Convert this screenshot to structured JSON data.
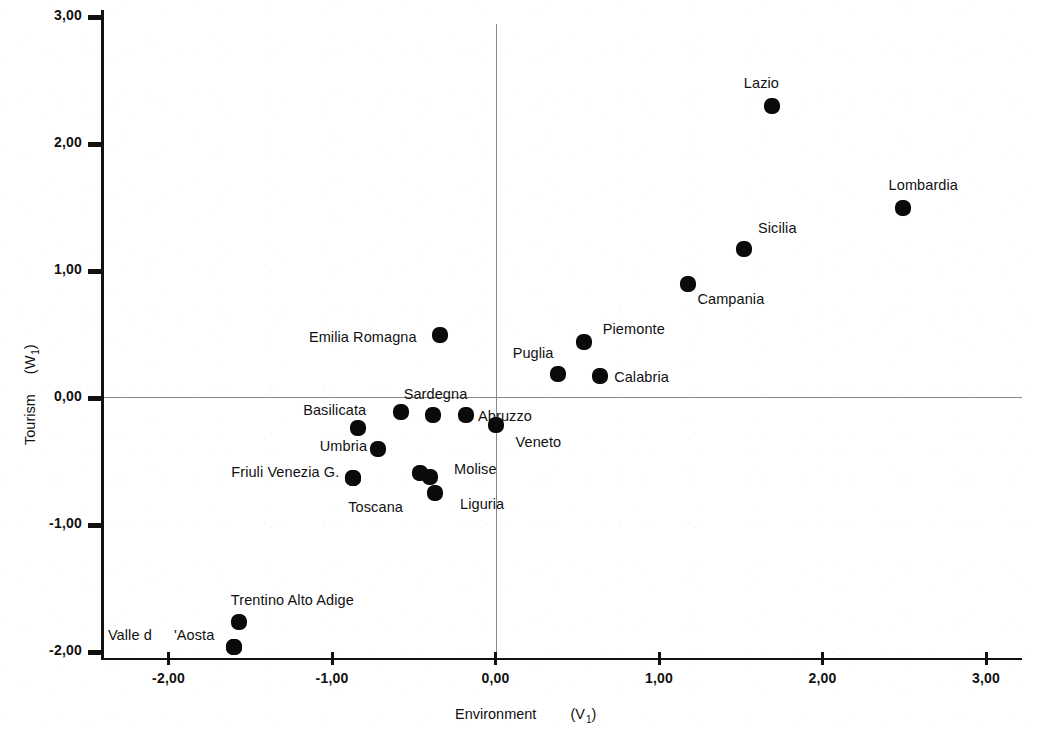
{
  "chart_data": {
    "type": "scatter",
    "title": "",
    "xlabel": "Environment",
    "xlabel_var": "(V",
    "xlabel_sub": "1",
    "xlabel_close": ")",
    "ylabel": "Tourism",
    "ylabel_var": "(W",
    "ylabel_sub": "1",
    "ylabel_close": ")",
    "xlim": [
      -2.4,
      3.0
    ],
    "ylim": [
      -2.0,
      3.0
    ],
    "grid": false,
    "legend": "none",
    "reference_lines": {
      "x": 0.0,
      "y": 0.0
    },
    "xticks": [
      "-2,00",
      "-1,00",
      "0,00",
      "1,00",
      "2,00",
      "3,00"
    ],
    "xtick_values": [
      -2,
      -1,
      0,
      1,
      2,
      3
    ],
    "yticks": [
      "3,00",
      "2,00",
      "1,00",
      "0,00",
      "-1,00",
      "-2,00"
    ],
    "ytick_values": [
      3,
      2,
      1,
      0,
      -1,
      -2
    ],
    "points": [
      {
        "label": "Lazio",
        "x": 1.69,
        "y": 2.3,
        "lx": -28,
        "ly": -22
      },
      {
        "label": "Lombardia",
        "x": 2.49,
        "y": 1.5,
        "lx": -14,
        "ly": -22
      },
      {
        "label": "Sicilia",
        "x": 1.52,
        "y": 1.17,
        "lx": 14,
        "ly": -20
      },
      {
        "label": "Campania",
        "x": 1.18,
        "y": 0.9,
        "lx": 9,
        "ly": 16
      },
      {
        "label": "Piemonte",
        "x": 0.54,
        "y": 0.44,
        "lx": 19,
        "ly": -12
      },
      {
        "label": "Emilia Romagna",
        "x": -0.34,
        "y": 0.5,
        "lx": -131,
        "ly": 3
      },
      {
        "label": "Puglia",
        "x": 0.38,
        "y": 0.19,
        "lx": -45,
        "ly": -20
      },
      {
        "label": "Calabria",
        "x": 0.64,
        "y": 0.17,
        "lx": 14,
        "ly": 2
      },
      {
        "label": "Sardegna",
        "x": -0.58,
        "y": -0.11,
        "lx": 3,
        "ly": -17
      },
      {
        "label": "",
        "x": -0.38,
        "y": -0.13,
        "lx": 0,
        "ly": 0
      },
      {
        "label": "Abruzzo",
        "x": -0.18,
        "y": -0.13,
        "lx": 12,
        "ly": 2
      },
      {
        "label": "Veneto",
        "x": 0.0,
        "y": -0.21,
        "lx": 20,
        "ly": 18
      },
      {
        "label": "Basilicata",
        "x": -0.84,
        "y": -0.24,
        "lx": -55,
        "ly": -17
      },
      {
        "label": "Umbria",
        "x": -0.72,
        "y": -0.4,
        "lx": -58,
        "ly": -2
      },
      {
        "label": "Friuli Venezia G.",
        "x": -0.87,
        "y": -0.63,
        "lx": -122,
        "ly": -5
      },
      {
        "label": "Molise",
        "x": -0.4,
        "y": -0.62,
        "lx": 24,
        "ly": -7
      },
      {
        "label": "",
        "x": -0.46,
        "y": -0.59,
        "lx": 0,
        "ly": 0
      },
      {
        "label": "Liguria",
        "x": -0.37,
        "y": -0.75,
        "lx": 25,
        "ly": 12
      },
      {
        "label": "Toscana",
        "x": -0.87,
        "y": -0.63,
        "lx": -5,
        "ly": 30
      },
      {
        "label": "Trentino Alto Adige",
        "x": -1.57,
        "y": -1.76,
        "lx": -8,
        "ly": -21
      },
      {
        "label": "Valle d",
        "x": -1.6,
        "y": -1.96,
        "lx": -126,
        "ly": -11
      },
      {
        "label": "'Aosta",
        "x": -1.6,
        "y": -1.96,
        "lx": -60,
        "ly": -11
      }
    ]
  }
}
